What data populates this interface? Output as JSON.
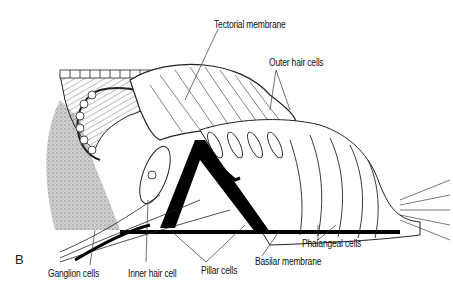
{
  "figure": {
    "panel_letter": "B",
    "labels": {
      "tectorial_membrane": "Tectorial membrane",
      "outer_hair_cells": "Outer hair cells",
      "ganglion_cells": "Ganglion cells",
      "inner_hair_cell": "Inner hair cell",
      "pillar_cells": "Pillar cells",
      "basilar_membrane": "Basilar membrane",
      "phalangeal_cells": "Phalangeal cells"
    }
  }
}
